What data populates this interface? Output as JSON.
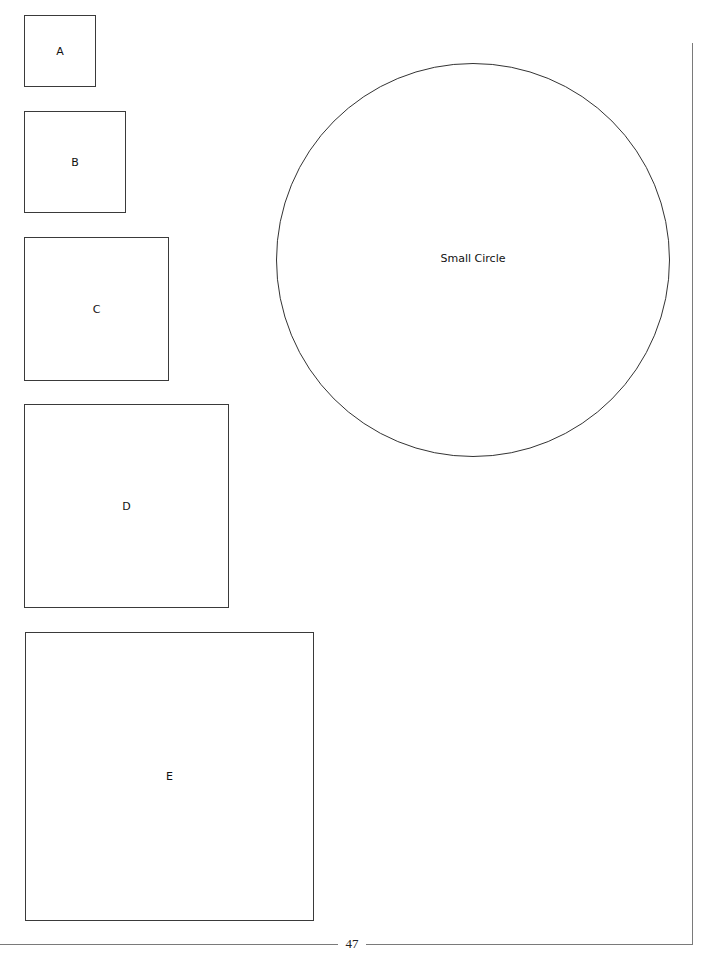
{
  "shapes": {
    "squares": [
      {
        "label": "A",
        "x": 24,
        "y": 15,
        "w": 72,
        "h": 72
      },
      {
        "label": "B",
        "x": 24,
        "y": 111,
        "w": 102,
        "h": 102
      },
      {
        "label": "C",
        "x": 24,
        "y": 237,
        "w": 145,
        "h": 144
      },
      {
        "label": "D",
        "x": 24,
        "y": 404,
        "w": 205,
        "h": 204
      },
      {
        "label": "E",
        "x": 25,
        "y": 632,
        "w": 289,
        "h": 289
      }
    ],
    "circle": {
      "label": "Small Circle",
      "cx": 473,
      "cy": 260,
      "r": 197
    }
  },
  "footer": {
    "page_number": "47"
  },
  "colors": {
    "stroke": "#3a3a3a",
    "frame": "#7a7a7a",
    "background": "#ffffff"
  }
}
